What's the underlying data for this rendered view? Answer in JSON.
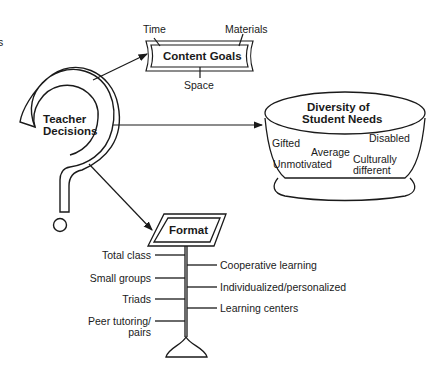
{
  "edge_fragment": "s",
  "center": {
    "line1": "Teacher",
    "line2": "Decisions"
  },
  "content_goals": {
    "title": "Content Goals",
    "labels": {
      "top_left": "Time",
      "top_right": "Materials",
      "bottom": "Space"
    }
  },
  "diversity": {
    "title_line1": "Diversity of",
    "title_line2": "Student Needs",
    "items": [
      "Gifted",
      "Disabled",
      "Average",
      "Unmotivated",
      "Culturally",
      "different"
    ]
  },
  "format": {
    "title": "Format",
    "left_items": [
      "Total class",
      "Small groups",
      "Triads",
      "Peer tutoring/",
      "pairs"
    ],
    "right_items": [
      "Cooperative learning",
      "Individualized/personalized",
      "Learning centers"
    ]
  },
  "colors": {
    "line": "#1a1a1a",
    "background": "#ffffff"
  }
}
